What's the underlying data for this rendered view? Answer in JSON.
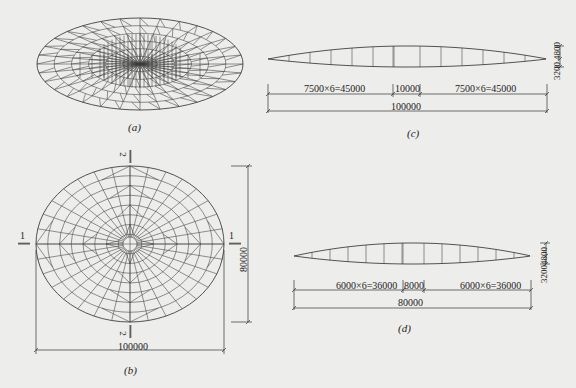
{
  "figure": {
    "background": "#ededeb",
    "line_color": "#2b2b2b",
    "panels": {
      "a": {
        "caption": "(a)",
        "description": "Perspective view of elliptical cable-dome / spherical lattice shell",
        "ellipse": {
          "cx": 140,
          "cy": 64,
          "rx": 103,
          "ry": 46
        }
      },
      "b": {
        "caption": "(b)",
        "description": "Plan view of elliptical lattice roof",
        "ellipse": {
          "cx": 130,
          "cy": 244,
          "rx": 94,
          "ry": 78
        },
        "rings": 8,
        "radials": 32,
        "section_marks": {
          "left": "1",
          "right": "1",
          "top": "2",
          "bottom": "2"
        },
        "dim_width": "100000",
        "dim_height": "80000"
      },
      "c": {
        "caption": "(c)",
        "description": "Section 1-1 (long axis) truss elevation",
        "dims": {
          "left": "7500×6=45000",
          "center": "10000",
          "right": "7500×6=45000",
          "total": "100000",
          "height_upper": "4800",
          "height_lower": "3200"
        }
      },
      "d": {
        "caption": "(d)",
        "description": "Section 2-2 (short axis) truss elevation",
        "dims": {
          "left": "6000×6=36000",
          "center": "8000",
          "right": "6000×6=36000",
          "total": "80000",
          "height_upper": "4800",
          "height_lower": "3200"
        }
      }
    }
  }
}
